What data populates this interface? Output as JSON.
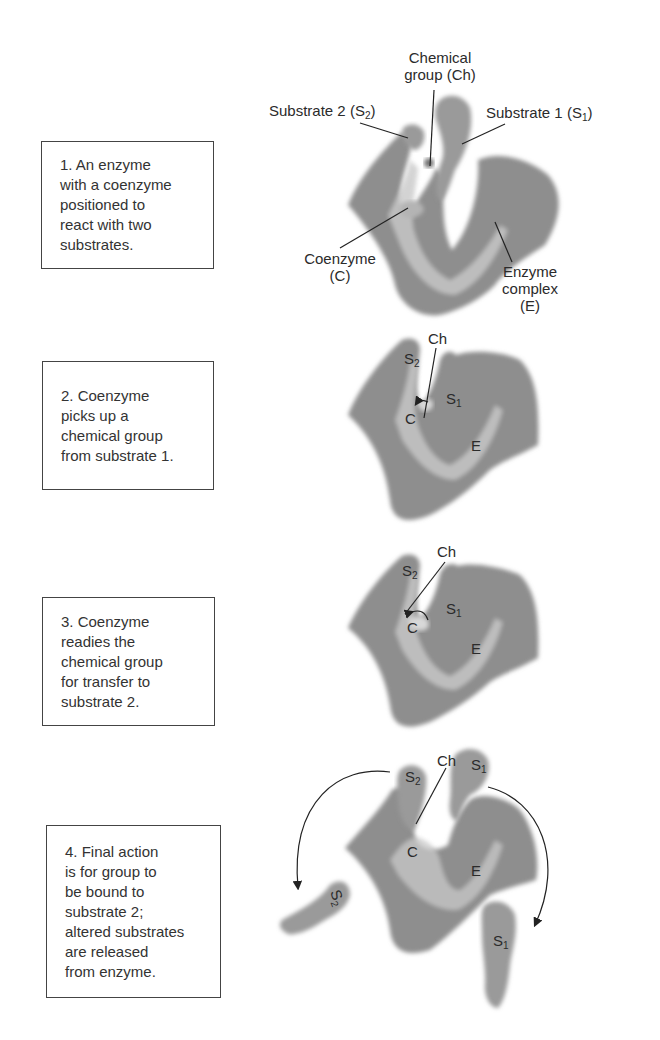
{
  "figure": {
    "steps": [
      {
        "number": 1,
        "text": "1. An enzyme\nwith a coenzyme\npositioned to\nreact with two\nsubstrates."
      },
      {
        "number": 2,
        "text": "2. Coenzyme\npicks up a\nchemical group\nfrom substrate 1."
      },
      {
        "number": 3,
        "text": "3. Coenzyme\nreadies the\nchemical group\nfor transfer to\nsubstrate 2."
      },
      {
        "number": 4,
        "text": "4. Final action\nis for group to\nbe bound to\nsubstrate 2;\naltered substrates\nare released\nfrom enzyme."
      }
    ],
    "panel1_labels": {
      "chemical_group_line1": "Chemical",
      "chemical_group_line2": "group (Ch)",
      "substrate2": "Substrate 2 (S",
      "substrate2_sub": "2",
      "substrate1": "Substrate 1 (S",
      "substrate1_sub": "1",
      "close_paren": ")",
      "coenzyme_line1": "Coenzyme",
      "coenzyme_line2": "(C)",
      "enzyme_line1": "Enzyme",
      "enzyme_line2": "complex",
      "enzyme_line3": "(E)"
    },
    "short_labels": {
      "S": "S",
      "sub1": "1",
      "sub2": "2",
      "Ch": "Ch",
      "C": "C",
      "E": "E"
    },
    "colors": {
      "shape_fill": "#8c8c8c",
      "shape_highlight": "#c8c8c8",
      "text": "#2b2b2b",
      "box_border": "#444444"
    }
  }
}
